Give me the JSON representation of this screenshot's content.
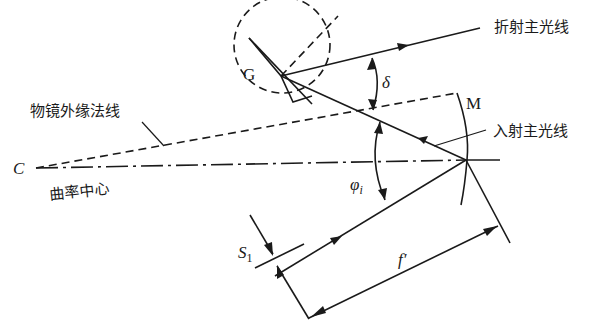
{
  "diagram": {
    "labels": {
      "refracted_chief_ray": "折射主光线",
      "incident_chief_ray": "入射主光线",
      "objective_edge_normal": "物镜外缘法线",
      "center_of_curvature": "曲率中心",
      "center_point": "C",
      "grating": "G",
      "mirror": "M",
      "deviation_angle": "δ",
      "incidence_angle": "φ",
      "incidence_angle_sub": "i",
      "slit": "S",
      "slit_sub": "1",
      "focal_length": "f′"
    },
    "colors": {
      "line": "#1a1a1a",
      "background": "#ffffff"
    }
  }
}
